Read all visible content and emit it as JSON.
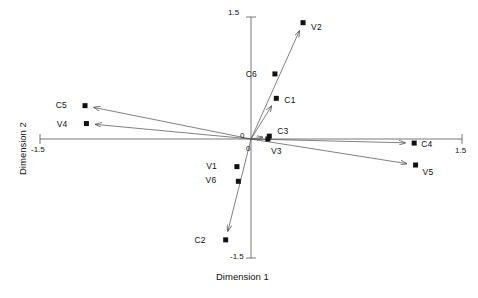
{
  "chart": {
    "type": "scatter",
    "title": "",
    "xlabel": "Dimension 1",
    "ylabel": "Dimension 2",
    "x_ticks": [
      "-1.5",
      "0",
      "1.5"
    ],
    "y_ticks": [
      "1.5",
      "0",
      "-1.5"
    ],
    "x_tick_left": "-1.5",
    "x_tick_zero": "0",
    "x_tick_right": "1.5",
    "y_tick_top": "1.5",
    "y_tick_zero": "0",
    "y_tick_bottom": "-1.5",
    "grid": false,
    "legend": "none",
    "marker_color": "#111111",
    "line_color": "#4a4a4a",
    "axis_color": "#555555"
  },
  "chart_data": {
    "type": "scatter",
    "title": "",
    "xlabel": "Dimension 1",
    "ylabel": "Dimension 2",
    "xlim": [
      -1.5,
      1.5
    ],
    "ylim": [
      -1.5,
      1.5
    ],
    "grid": false,
    "legend": "none",
    "points": [
      {
        "label": "V2",
        "x": 0.37,
        "y": 1.43,
        "label_dx": 8,
        "label_dy": 4,
        "vector": true,
        "arrow": true
      },
      {
        "label": "C6",
        "x": 0.17,
        "y": 0.8,
        "label_dx": -18,
        "label_dy": 0,
        "vector": false,
        "arrow": false
      },
      {
        "label": "C1",
        "x": 0.18,
        "y": 0.5,
        "label_dx": 8,
        "label_dy": 2,
        "vector": true,
        "arrow": true
      },
      {
        "label": "C5",
        "x": -1.18,
        "y": 0.41,
        "label_dx": -18,
        "label_dy": -1,
        "vector": true,
        "arrow": true
      },
      {
        "label": "V4",
        "x": -1.17,
        "y": 0.19,
        "label_dx": -19,
        "label_dy": 0,
        "vector": true,
        "arrow": true
      },
      {
        "label": "C3",
        "x": 0.13,
        "y": 0.035,
        "label_dx": 8,
        "label_dy": -5,
        "vector": true,
        "arrow": true
      },
      {
        "label": "V3",
        "x": 0.12,
        "y": 0.0,
        "label_dx": 3,
        "label_dy": 12,
        "vector": false,
        "arrow": false
      },
      {
        "label": "C4",
        "x": 1.16,
        "y": -0.05,
        "label_dx": 7,
        "label_dy": 1,
        "vector": true,
        "arrow": true
      },
      {
        "label": "V5",
        "x": 1.17,
        "y": -0.32,
        "label_dx": 7,
        "label_dy": 7,
        "vector": true,
        "arrow": true
      },
      {
        "label": "V1",
        "x": -0.1,
        "y": -0.34,
        "label_dx": -20,
        "label_dy": -1,
        "vector": false,
        "arrow": false
      },
      {
        "label": "V6",
        "x": -0.09,
        "y": -0.52,
        "label_dx": -22,
        "label_dy": -1,
        "vector": false,
        "arrow": false
      },
      {
        "label": "C2",
        "x": -0.18,
        "y": -1.24,
        "label_dx": -20,
        "label_dy": 0,
        "vector": true,
        "arrow": true
      }
    ]
  }
}
